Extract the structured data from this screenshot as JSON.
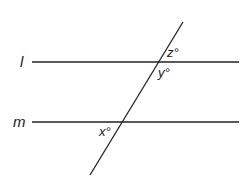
{
  "diagram": {
    "lines": [
      {
        "name": "l",
        "label": "l",
        "y": 62
      },
      {
        "name": "m",
        "label": "m",
        "y": 122
      }
    ],
    "transversal": {
      "x1": 183,
      "y1": 22,
      "x2": 90,
      "y2": 175
    },
    "angles": [
      {
        "name": "z",
        "label": "z°"
      },
      {
        "name": "y",
        "label": "y°"
      },
      {
        "name": "x",
        "label": "x°"
      }
    ],
    "colors": {
      "stroke": "#222222",
      "background": "#ffffff"
    }
  }
}
